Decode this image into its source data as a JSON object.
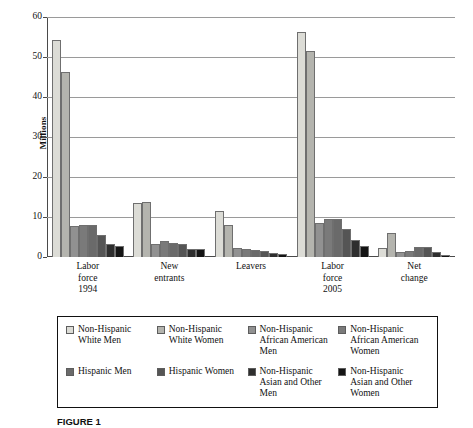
{
  "figure": {
    "caption": "FIGURE 1"
  },
  "chart_data": {
    "type": "bar",
    "title": "",
    "xlabel": "",
    "ylabel": "Millions",
    "ylim": [
      0,
      60
    ],
    "yticks": [
      0,
      10,
      20,
      30,
      40,
      50,
      60
    ],
    "grid": true,
    "legend_position": "bottom",
    "categories": [
      "Labor force 1994",
      "New entrants",
      "Leavers",
      "Labor force 2005",
      "Net change"
    ],
    "category_lines": [
      [
        "Labor",
        "force",
        "1994"
      ],
      [
        "New",
        "entrants"
      ],
      [
        "Leavers"
      ],
      [
        "Labor",
        "force",
        "2005"
      ],
      [
        "Net",
        "change"
      ]
    ],
    "series": [
      {
        "name": "Non-Hispanic White Men",
        "color": "#dcdcd6",
        "values": [
          54.2,
          13.5,
          11.5,
          56.3,
          2.2
        ]
      },
      {
        "name": "Non-Hispanic White Women",
        "color": "#b4b4ae",
        "values": [
          46.2,
          13.8,
          7.9,
          51.6,
          6.0
        ]
      },
      {
        "name": "Non-Hispanic African American Men",
        "color": "#919191",
        "values": [
          7.7,
          3.3,
          2.2,
          8.6,
          1.3
        ]
      },
      {
        "name": "Non-Hispanic African American Women",
        "color": "#7a7a7a",
        "values": [
          7.9,
          4.0,
          2.0,
          9.4,
          1.6
        ]
      },
      {
        "name": "Hispanic Men",
        "color": "#6a6a6a",
        "values": [
          7.9,
          3.6,
          1.8,
          9.4,
          2.4
        ]
      },
      {
        "name": "Hispanic Women",
        "color": "#555555",
        "values": [
          5.4,
          3.3,
          1.4,
          7.1,
          2.4
        ]
      },
      {
        "name": "Non-Hispanic Asian and Other Men",
        "color": "#2e2e2e",
        "values": [
          3.3,
          2.0,
          0.9,
          4.3,
          1.2
        ]
      },
      {
        "name": "Non-Hispanic Asian and Other Women",
        "color": "#141414",
        "values": [
          2.8,
          2.0,
          0.7,
          2.7,
          0.6
        ]
      }
    ],
    "legend": [
      {
        "label_lines": [
          "Non-Hispanic",
          "White Men"
        ],
        "color": "#dcdcd6"
      },
      {
        "label_lines": [
          "Non-Hispanic",
          "White Women"
        ],
        "color": "#b4b4ae"
      },
      {
        "label_lines": [
          "Non-Hispanic",
          "African American",
          "Men"
        ],
        "color": "#919191"
      },
      {
        "label_lines": [
          "Non-Hispanic",
          "African American",
          "Women"
        ],
        "color": "#7a7a7a"
      },
      {
        "label_lines": [
          "Hispanic Men"
        ],
        "color": "#6a6a6a"
      },
      {
        "label_lines": [
          "Hispanic Women"
        ],
        "color": "#555555"
      },
      {
        "label_lines": [
          "Non-Hispanic",
          "Asian and Other",
          "Men"
        ],
        "color": "#2e2e2e"
      },
      {
        "label_lines": [
          "Non-Hispanic",
          "Asian and Other",
          "Women"
        ],
        "color": "#141414"
      }
    ]
  }
}
